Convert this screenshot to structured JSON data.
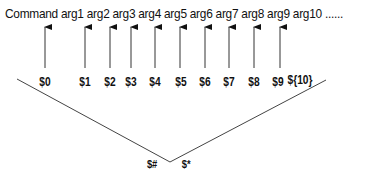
{
  "command_line": "Command arg1 arg2 arg3 arg4 arg5 arg6 arg7 arg8 arg9 arg10 ......",
  "parameters": [
    {
      "label": "$0",
      "x": 45
    },
    {
      "label": "$1",
      "x": 85
    },
    {
      "label": "$2",
      "x": 110
    },
    {
      "label": "$3",
      "x": 131
    },
    {
      "label": "$4",
      "x": 155
    },
    {
      "label": "$5",
      "x": 181
    },
    {
      "label": "$6",
      "x": 205
    },
    {
      "label": "$7",
      "x": 229
    },
    {
      "label": "$8",
      "x": 254
    },
    {
      "label": "${10}",
      "x": 280
    }
  ],
  "label_9": "$9",
  "bottom_labels": {
    "count": "$#",
    "all": "$*"
  }
}
